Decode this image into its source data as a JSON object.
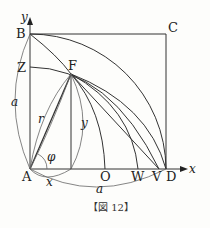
{
  "figure": {
    "caption": "【図 12】",
    "points": {
      "A": "A",
      "B": "B",
      "C": "C",
      "D": "D",
      "F": "F",
      "Z": "Z",
      "O": "O",
      "W": "W",
      "V": "V"
    },
    "axes": {
      "x": "x",
      "y": "y"
    },
    "symbols": {
      "side_vertical": "a",
      "side_horizontal": "a",
      "radius": "r",
      "height": "y",
      "base": "x",
      "angle": "φ"
    }
  }
}
